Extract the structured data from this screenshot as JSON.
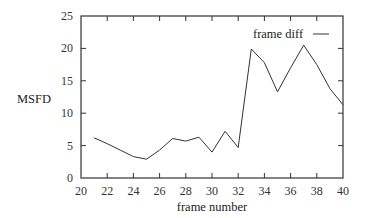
{
  "chart_data": {
    "type": "line",
    "title": "",
    "xlabel": "frame number",
    "ylabel": "MSFD",
    "xlim": [
      20,
      40
    ],
    "ylim": [
      0,
      25
    ],
    "xticks": [
      20,
      22,
      24,
      26,
      28,
      30,
      32,
      34,
      36,
      38,
      40
    ],
    "yticks": [
      0,
      5,
      10,
      15,
      20,
      25
    ],
    "grid": false,
    "legend_position": "upper right",
    "series": [
      {
        "name": "frame diff",
        "color": "#333333",
        "x": [
          21,
          22,
          23,
          24,
          25,
          26,
          27,
          28,
          29,
          30,
          31,
          32,
          33,
          34,
          35,
          36,
          37,
          38,
          39,
          40
        ],
        "values": [
          6.2,
          5.3,
          4.3,
          3.3,
          2.9,
          4.3,
          6.1,
          5.7,
          6.3,
          4.0,
          7.2,
          4.7,
          19.9,
          17.8,
          13.3,
          17.0,
          20.5,
          17.5,
          13.8,
          11.3
        ]
      }
    ]
  }
}
